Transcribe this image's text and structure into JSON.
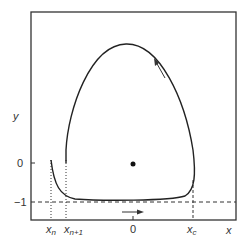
{
  "diagram": {
    "axes": {
      "x_label": "x",
      "y_label": "y",
      "y_ticks": [
        "0",
        "−1"
      ],
      "x_ticks": [
        {
          "base": "x",
          "sub": "n"
        },
        {
          "base": "x",
          "sub": "n+1"
        },
        {
          "base": "0",
          "sub": ""
        },
        {
          "base": "x",
          "sub": "c"
        }
      ]
    },
    "elements": {
      "fixed_point": "equilibrium point at origin",
      "trajectory": "relaxation oscillation limit cycle",
      "arrow_bottom": "rightward flow arrow",
      "arrow_right": "upward flow arrow",
      "dashed_line": "y = −1 level"
    },
    "colors": {
      "line": "#222222",
      "text": "#333333"
    }
  }
}
